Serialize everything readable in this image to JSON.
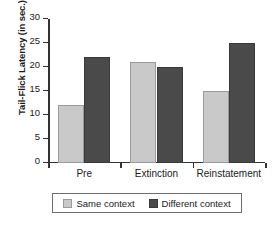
{
  "chart_data": {
    "type": "bar",
    "title": "",
    "xlabel": "",
    "ylabel": "Tail-Flick Latency (in sec.)",
    "categories": [
      "Pre",
      "Extinction",
      "Reinstatement"
    ],
    "series": [
      {
        "name": "Same context",
        "color": "#c9c9c9",
        "values": [
          12,
          21,
          15
        ]
      },
      {
        "name": "Different context",
        "color": "#4a4a4a",
        "values": [
          22,
          20,
          25
        ]
      }
    ],
    "ylim": [
      0,
      30
    ],
    "yticks": [
      0,
      5,
      10,
      15,
      20,
      25,
      30
    ],
    "ytick_labels": [
      "0",
      "5",
      "10",
      "15",
      "20",
      "25",
      "30"
    ],
    "grid": false,
    "legend_position": "bottom"
  }
}
